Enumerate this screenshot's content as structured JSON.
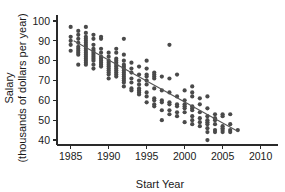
{
  "chart_data": {
    "type": "scatter",
    "title": "",
    "xlabel": "Start Year",
    "ylabel_line1": "Salary",
    "ylabel_line2": "(thousands of dollars per year)",
    "xlim": [
      1983.2,
      2011.5
    ],
    "ylim": [
      37.5,
      102
    ],
    "xticks": [
      1985,
      1990,
      1995,
      2000,
      2005,
      2010
    ],
    "yticks": [
      40,
      50,
      60,
      70,
      80,
      90,
      100
    ],
    "grid": false,
    "legend": null,
    "marker": {
      "shape": "circle",
      "color": "#4a4a4a",
      "size": 2.1
    },
    "trend_line": {
      "label": "least-squares regression line",
      "color": "#555555",
      "x_start": 1985.4,
      "y_start": 90.0,
      "x_end": 2007.1,
      "y_end": 44.2
    },
    "points": [
      [
        1985,
        97
      ],
      [
        1985,
        92
      ],
      [
        1985,
        90
      ],
      [
        1985,
        88
      ],
      [
        1985,
        85
      ],
      [
        1986,
        95
      ],
      [
        1986,
        93
      ],
      [
        1986,
        91
      ],
      [
        1986,
        89
      ],
      [
        1986,
        87
      ],
      [
        1986,
        86
      ],
      [
        1986,
        85
      ],
      [
        1986,
        84
      ],
      [
        1986,
        83
      ],
      [
        1986,
        78
      ],
      [
        1987,
        97
      ],
      [
        1987,
        94
      ],
      [
        1987,
        92
      ],
      [
        1987,
        91
      ],
      [
        1987,
        90
      ],
      [
        1987,
        89
      ],
      [
        1987,
        88
      ],
      [
        1987,
        87
      ],
      [
        1987,
        86
      ],
      [
        1987,
        85
      ],
      [
        1987,
        84
      ],
      [
        1987,
        83
      ],
      [
        1987,
        82
      ],
      [
        1987,
        81
      ],
      [
        1987,
        80
      ],
      [
        1987,
        79
      ],
      [
        1987,
        78
      ],
      [
        1988,
        93
      ],
      [
        1988,
        91
      ],
      [
        1988,
        88
      ],
      [
        1988,
        86
      ],
      [
        1988,
        85
      ],
      [
        1988,
        84
      ],
      [
        1988,
        83
      ],
      [
        1988,
        82
      ],
      [
        1988,
        81
      ],
      [
        1988,
        80
      ],
      [
        1988,
        78
      ],
      [
        1988,
        76
      ],
      [
        1989,
        92
      ],
      [
        1989,
        91
      ],
      [
        1989,
        86
      ],
      [
        1989,
        84
      ],
      [
        1989,
        82
      ],
      [
        1989,
        81
      ],
      [
        1989,
        80
      ],
      [
        1989,
        79
      ],
      [
        1989,
        78
      ],
      [
        1989,
        77
      ],
      [
        1990,
        84
      ],
      [
        1990,
        82
      ],
      [
        1990,
        80
      ],
      [
        1990,
        79
      ],
      [
        1990,
        78
      ],
      [
        1990,
        77
      ],
      [
        1990,
        76
      ],
      [
        1990,
        75
      ],
      [
        1990,
        74
      ],
      [
        1990,
        73
      ],
      [
        1990,
        71
      ],
      [
        1991,
        86
      ],
      [
        1991,
        84
      ],
      [
        1991,
        81
      ],
      [
        1991,
        80
      ],
      [
        1991,
        79
      ],
      [
        1991,
        78
      ],
      [
        1991,
        77
      ],
      [
        1991,
        76
      ],
      [
        1991,
        75
      ],
      [
        1991,
        74
      ],
      [
        1991,
        73
      ],
      [
        1991,
        72
      ],
      [
        1992,
        91
      ],
      [
        1992,
        83
      ],
      [
        1992,
        80
      ],
      [
        1992,
        78
      ],
      [
        1992,
        77
      ],
      [
        1992,
        76
      ],
      [
        1992,
        75
      ],
      [
        1992,
        74
      ],
      [
        1992,
        73
      ],
      [
        1992,
        72
      ],
      [
        1992,
        71
      ],
      [
        1992,
        70
      ],
      [
        1992,
        69
      ],
      [
        1992,
        67
      ],
      [
        1993,
        79
      ],
      [
        1993,
        76
      ],
      [
        1993,
        74
      ],
      [
        1993,
        71
      ],
      [
        1993,
        69
      ],
      [
        1993,
        66
      ],
      [
        1993,
        65
      ],
      [
        1994,
        77
      ],
      [
        1994,
        73
      ],
      [
        1994,
        70
      ],
      [
        1994,
        68
      ],
      [
        1994,
        66
      ],
      [
        1994,
        65
      ],
      [
        1994,
        64
      ],
      [
        1994,
        63
      ],
      [
        1995,
        80
      ],
      [
        1995,
        76
      ],
      [
        1995,
        73
      ],
      [
        1995,
        72
      ],
      [
        1995,
        70
      ],
      [
        1995,
        68
      ],
      [
        1995,
        64
      ],
      [
        1995,
        62
      ],
      [
        1995,
        59
      ],
      [
        1996,
        74
      ],
      [
        1996,
        73
      ],
      [
        1996,
        72
      ],
      [
        1996,
        71
      ],
      [
        1996,
        66
      ],
      [
        1996,
        61
      ],
      [
        1996,
        60
      ],
      [
        1996,
        58
      ],
      [
        1996,
        57
      ],
      [
        1997,
        72
      ],
      [
        1997,
        65
      ],
      [
        1997,
        60
      ],
      [
        1997,
        59
      ],
      [
        1997,
        55
      ],
      [
        1997,
        50
      ],
      [
        1998,
        88
      ],
      [
        1998,
        71
      ],
      [
        1998,
        64
      ],
      [
        1998,
        59
      ],
      [
        1998,
        58
      ],
      [
        1998,
        55
      ],
      [
        1998,
        53
      ],
      [
        1999,
        73
      ],
      [
        1999,
        62
      ],
      [
        1999,
        58
      ],
      [
        1999,
        57
      ],
      [
        1999,
        54
      ],
      [
        1999,
        52
      ],
      [
        2000,
        65
      ],
      [
        2000,
        60
      ],
      [
        2000,
        58
      ],
      [
        2000,
        57
      ],
      [
        2000,
        56
      ],
      [
        2000,
        54
      ],
      [
        2000,
        49
      ],
      [
        2001,
        67
      ],
      [
        2001,
        64
      ],
      [
        2001,
        62
      ],
      [
        2001,
        57
      ],
      [
        2001,
        56
      ],
      [
        2001,
        55
      ],
      [
        2001,
        52
      ],
      [
        2001,
        50
      ],
      [
        2001,
        48
      ],
      [
        2002,
        61
      ],
      [
        2002,
        58
      ],
      [
        2002,
        54
      ],
      [
        2002,
        51
      ],
      [
        2002,
        49
      ],
      [
        2002,
        47
      ],
      [
        2003,
        62
      ],
      [
        2003,
        56
      ],
      [
        2003,
        52
      ],
      [
        2003,
        50
      ],
      [
        2003,
        49
      ],
      [
        2003,
        48
      ],
      [
        2003,
        46
      ],
      [
        2003,
        44
      ],
      [
        2003,
        40
      ],
      [
        2004,
        53
      ],
      [
        2004,
        51
      ],
      [
        2004,
        50
      ],
      [
        2004,
        48
      ],
      [
        2004,
        45
      ],
      [
        2004,
        44
      ],
      [
        2005,
        53
      ],
      [
        2005,
        52
      ],
      [
        2005,
        47
      ],
      [
        2005,
        46
      ],
      [
        2005,
        45
      ],
      [
        2005,
        44
      ],
      [
        2006,
        53
      ],
      [
        2006,
        48
      ],
      [
        2006,
        45
      ],
      [
        2006,
        44
      ],
      [
        2007,
        45
      ]
    ]
  }
}
